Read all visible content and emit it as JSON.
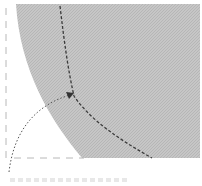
{
  "figure": {
    "type": "diagram",
    "colors": {
      "region_fill": "#c4c4c4",
      "region_texture": "#b0b0b0",
      "curve": "#3a3a3a",
      "arrow": "#555555",
      "axes": "#b8b8b8",
      "background": "#ffffff"
    },
    "elements": {
      "shaded_region": "quarter-disk",
      "boundary_curve": "dashed",
      "pointer_arrow": "dotted",
      "axes": "dashed left and bottom"
    }
  }
}
